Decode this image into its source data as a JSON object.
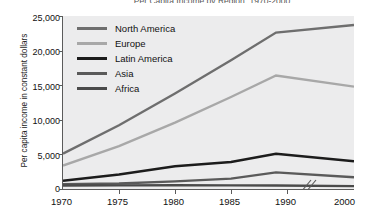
{
  "chart_data": {
    "type": "line",
    "title": "Per Capita Income by Region, 1970-2000",
    "xlabel": "",
    "ylabel": "Per capita income in constant dollars",
    "xlim": [
      1970,
      2000
    ],
    "ylim": [
      0,
      25000
    ],
    "yticks": [
      "0",
      "5,000",
      "10,000",
      "15,000",
      "20,000",
      "25,000"
    ],
    "ytick_values": [
      0,
      5000,
      10000,
      15000,
      20000,
      25000
    ],
    "xticks": [
      "1970",
      "1975",
      "1980",
      "1985",
      "1990",
      "2000"
    ],
    "xtick_values": [
      1970,
      1975,
      1980,
      1985,
      1990,
      2000
    ],
    "axis_break": true,
    "axis_break_note": "break between 1990 and 2000",
    "grid": false,
    "legend_position": "upper-left-inside",
    "plot_background": "#ececed",
    "series": [
      {
        "name": "North America",
        "color": "#6e6e6e",
        "x": [
          1970,
          1975,
          1980,
          1985,
          1989,
          2000
        ],
        "values": [
          5100,
          9200,
          13800,
          18600,
          22600,
          23700
        ]
      },
      {
        "name": "Europe",
        "color": "#a8a8a8",
        "x": [
          1970,
          1975,
          1980,
          1985,
          1989,
          2000
        ],
        "values": [
          3400,
          6200,
          9600,
          13300,
          16400,
          14800
        ]
      },
      {
        "name": "Latin America",
        "color": "#1c1c1c",
        "x": [
          1970,
          1975,
          1980,
          1985,
          1989,
          2000
        ],
        "values": [
          1200,
          2100,
          3300,
          3900,
          5100,
          4000
        ]
      },
      {
        "name": "Asia",
        "color": "#5a5a5a",
        "x": [
          1970,
          1975,
          1980,
          1985,
          1989,
          2000
        ],
        "values": [
          700,
          800,
          1100,
          1500,
          2400,
          1700
        ]
      },
      {
        "name": "Africa",
        "color": "#4a4a4a",
        "x": [
          1970,
          1975,
          1980,
          1985,
          1989,
          2000
        ],
        "values": [
          500,
          520,
          540,
          520,
          500,
          420
        ]
      }
    ]
  },
  "legend": {
    "items": [
      {
        "label": "North America"
      },
      {
        "label": "Europe"
      },
      {
        "label": "Latin America"
      },
      {
        "label": "Asia"
      },
      {
        "label": "Africa"
      }
    ]
  }
}
